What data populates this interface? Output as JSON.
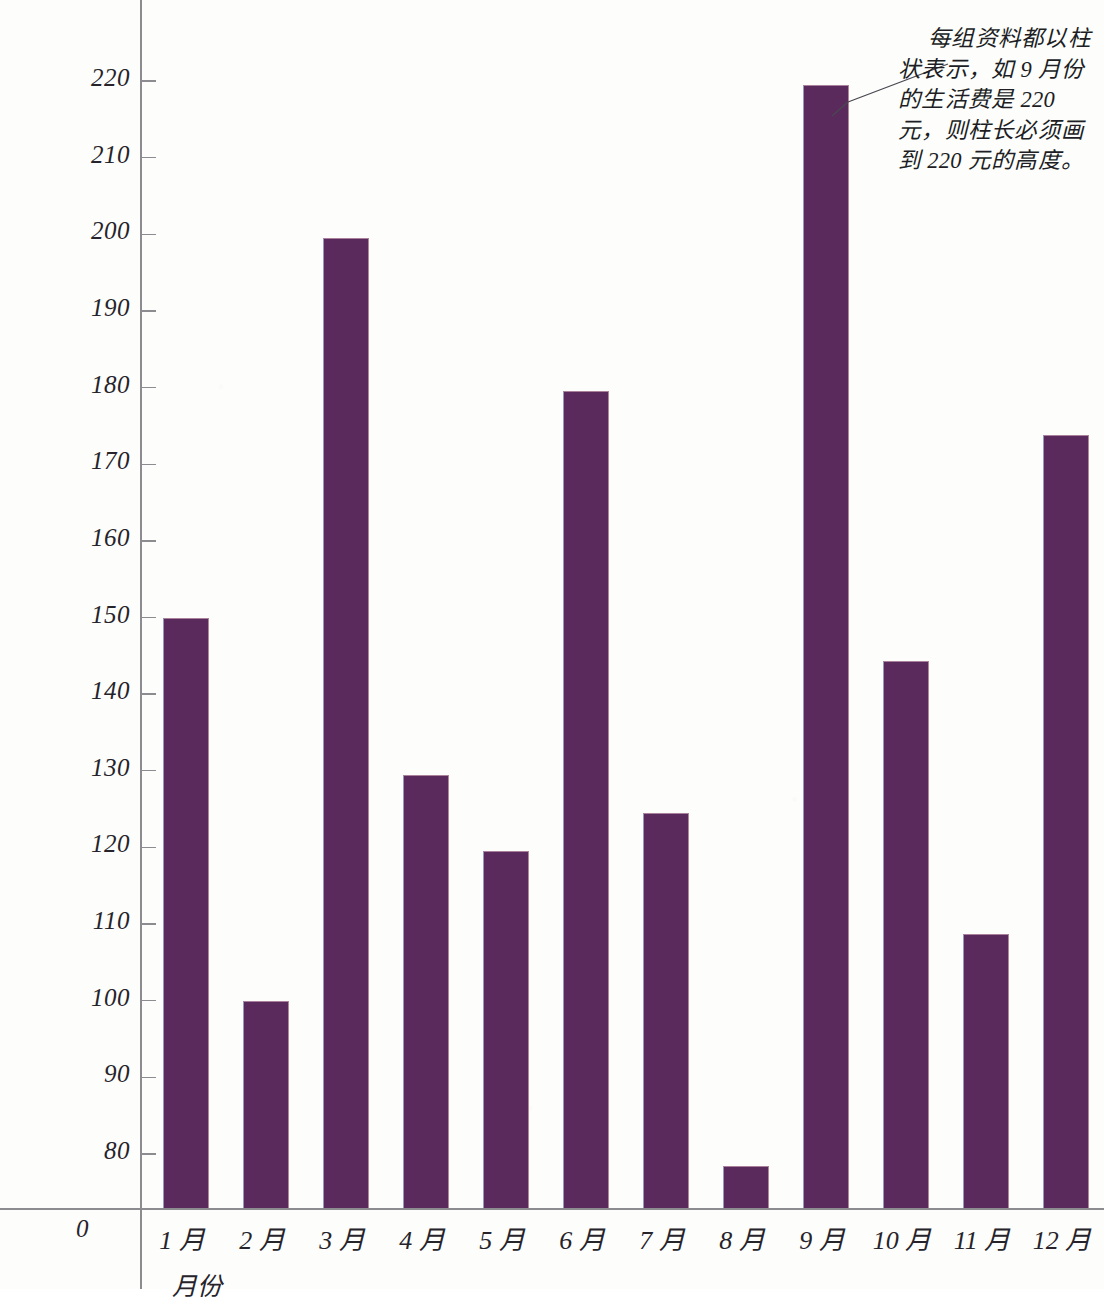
{
  "chart_data": {
    "type": "bar",
    "title": "",
    "xlabel": "月份",
    "ylabel": "",
    "categories": [
      "1 月",
      "2 月",
      "3 月",
      "4 月",
      "5 月",
      "6 月",
      "7 月",
      "8 月",
      "9 月",
      "10 月",
      "11 月",
      "12 月"
    ],
    "values": [
      150,
      100,
      199.5,
      129.5,
      119.5,
      179.5,
      124.5,
      78.5,
      219.5,
      144.3,
      108.7,
      173.8
    ],
    "ylim": [
      80,
      225
    ],
    "axis_break": true,
    "baseline_label": "0",
    "ytick_labels": [
      "220",
      "210",
      "200",
      "190",
      "180",
      "170",
      "160",
      "150",
      "140",
      "130",
      "120",
      "110",
      "100",
      "90",
      "80"
    ],
    "ytick_values": [
      220,
      210,
      200,
      190,
      180,
      170,
      160,
      150,
      140,
      130,
      120,
      110,
      100,
      90,
      80
    ],
    "grid": false,
    "legend": null,
    "bar_color": "#5a2a5c",
    "axis_color": "#8b8b90",
    "text_color": "#26242a",
    "annotation": "每组资料都以柱状表示，如 9 月份的生活费是 220 元，则柱长必须画到 220 元的高度。"
  }
}
